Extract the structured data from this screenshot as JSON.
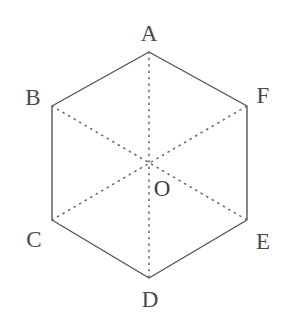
{
  "figure": {
    "name": "regular-hexagon-with-diagonals",
    "background_color": "#ffffff",
    "outline_color": "#555555",
    "diagonal_color": "#6b6b6b",
    "label_color": "#4a4a4a",
    "outline_width": 1.4,
    "diagonal_width": 1.6,
    "viewbox": "0 0 292 335"
  },
  "geometry": {
    "outline_points": "149,52 247,106 247,220 149,278 52,220 52,106",
    "center": {
      "x": 149,
      "y": 165
    },
    "vertices": [
      {
        "id": "A",
        "x": 149,
        "y": 52
      },
      {
        "id": "B",
        "x": 52,
        "y": 106
      },
      {
        "id": "C",
        "x": 52,
        "y": 220
      },
      {
        "id": "D",
        "x": 149,
        "y": 278
      },
      {
        "id": "E",
        "x": 247,
        "y": 220
      },
      {
        "id": "F",
        "x": 247,
        "y": 106
      }
    ],
    "diagonals": [
      {
        "id": "A-D",
        "x1": 149,
        "y1": 52,
        "x2": 149,
        "y2": 278
      },
      {
        "id": "B-E",
        "x1": 52,
        "y1": 106,
        "x2": 247,
        "y2": 220
      },
      {
        "id": "C-F",
        "x1": 52,
        "y1": 220,
        "x2": 247,
        "y2": 106
      }
    ]
  },
  "labels": {
    "vertex_a": "A",
    "vertex_b": "B",
    "vertex_c": "C",
    "vertex_d": "D",
    "vertex_e": "E",
    "vertex_f": "F",
    "center_o": "O"
  }
}
